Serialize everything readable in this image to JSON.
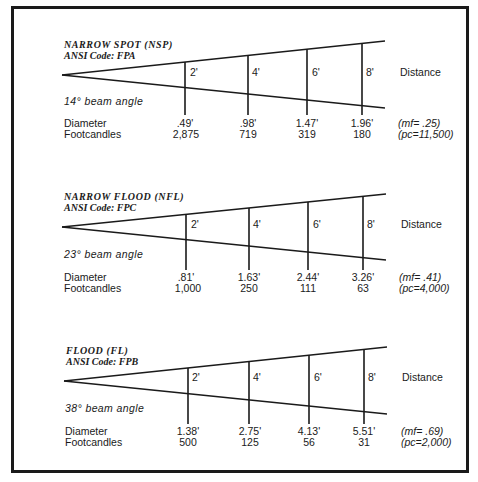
{
  "labels": {
    "distance": "Distance",
    "diameter": "Diameter",
    "footcandles": "Footcandles"
  },
  "distances": [
    "2'",
    "4'",
    "6'",
    "8'"
  ],
  "lamps": [
    {
      "title": "NARROW SPOT (NSP)",
      "ansi": "ANSI Code: FPA",
      "beam_angle": "14° beam angle",
      "diameters": [
        ".49'",
        ".98'",
        "1.47'",
        "1.96'"
      ],
      "footcandles": [
        "2,875",
        "719",
        "319",
        "180"
      ],
      "mf": "(mf= .25)",
      "pc": "(pc=11,500)"
    },
    {
      "title": "NARROW FLOOD (NFL)",
      "ansi": "ANSI Code: FPC",
      "beam_angle": "23° beam angle",
      "diameters": [
        ".81'",
        "1.63'",
        "2.44'",
        "3.26'"
      ],
      "footcandles": [
        "1,000",
        "250",
        "111",
        "63"
      ],
      "mf": "(mf= .41)",
      "pc": "(pc=4,000)"
    },
    {
      "title": "FLOOD (FL)",
      "ansi": "ANSI Code: FPB",
      "beam_angle": "38° beam angle",
      "diameters": [
        "1.38'",
        "2.75'",
        "4.13'",
        "5.51'"
      ],
      "footcandles": [
        "500",
        "125",
        "56",
        "31"
      ],
      "mf": "(mf= .69)",
      "pc": "(pc=2,000)"
    }
  ]
}
